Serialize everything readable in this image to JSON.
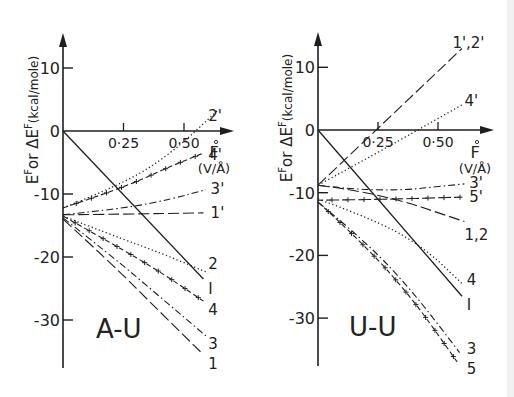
{
  "figure": {
    "edge_band_color": "#f1f1f1",
    "ink_color": "#1e1e1e"
  },
  "chart_data": [
    {
      "type": "line",
      "panel_label": "A-U",
      "ylabel": "E^F or ΔE^F (kcal/mole)",
      "xlabel": "F (V/Å)",
      "xlabel_main": "F",
      "xlabel_unit": "(V/Å)",
      "x_ticks": [
        0.25,
        0.5
      ],
      "x_tick_labels": [
        "0·25",
        "0·50"
      ],
      "y_ticks": [
        10,
        0,
        -10,
        -20,
        -30
      ],
      "y_tick_labels": [
        "10",
        "0",
        "-10",
        "-20",
        "-30"
      ],
      "xlim": [
        0,
        0.72
      ],
      "ylim": [
        -38,
        15
      ],
      "grid": false,
      "legend": "inline labels at line ends",
      "series": [
        {
          "name": "I",
          "style": "solid",
          "x": [
            0,
            0.58
          ],
          "y": [
            0,
            -23.5
          ],
          "label_pos": [
            0.6,
            -24.9
          ]
        },
        {
          "name": "2'",
          "style": "dotted",
          "x": [
            0,
            0.25,
            0.45,
            0.64
          ],
          "y": [
            -12.2,
            -8.4,
            -3.5,
            3.3
          ],
          "label_pos": [
            0.6,
            2.5
          ]
        },
        {
          "name": "4'",
          "style": "dash-cross",
          "x": [
            0,
            0.25,
            0.45,
            0.58
          ],
          "y": [
            -12.2,
            -9.0,
            -5.5,
            -3.5
          ],
          "label_pos": [
            0.6,
            -3.6
          ]
        },
        {
          "name": "3'",
          "style": "dash-dot",
          "x": [
            0,
            0.25,
            0.45,
            0.59
          ],
          "y": [
            -13.3,
            -12.3,
            -10.8,
            -9.3
          ],
          "label_pos": [
            0.61,
            -9.1
          ]
        },
        {
          "name": "1'",
          "style": "long-dash",
          "x": [
            0,
            0.25,
            0.58
          ],
          "y": [
            -13.3,
            -13.2,
            -13.0
          ],
          "label_pos": [
            0.61,
            -12.8
          ]
        },
        {
          "name": "2",
          "style": "dotted",
          "x": [
            0,
            0.2,
            0.4,
            0.6
          ],
          "y": [
            -13.5,
            -16.5,
            -19.3,
            -22.5
          ],
          "label_pos": [
            0.6,
            -20.9
          ]
        },
        {
          "name": "4",
          "style": "dash-cross",
          "x": [
            0,
            0.2,
            0.4,
            0.58
          ],
          "y": [
            -13.5,
            -17.8,
            -22.3,
            -27.0
          ],
          "label_pos": [
            0.6,
            -28.3
          ]
        },
        {
          "name": "3",
          "style": "dash-dot",
          "x": [
            0,
            0.2,
            0.4,
            0.59
          ],
          "y": [
            -13.8,
            -19.8,
            -26.3,
            -32.5
          ],
          "label_pos": [
            0.6,
            -33.6
          ]
        },
        {
          "name": "1",
          "style": "long-dash",
          "x": [
            0,
            0.2,
            0.4,
            0.58
          ],
          "y": [
            -14.0,
            -21.0,
            -28.7,
            -35.5
          ],
          "label_pos": [
            0.6,
            -36.8
          ]
        }
      ]
    },
    {
      "type": "line",
      "panel_label": "U-U",
      "ylabel": "E^F or ΔE^F (kcal/mole)",
      "xlabel": "F (V/Å)",
      "xlabel_main": "F",
      "xlabel_unit": "(V/Å)",
      "x_ticks": [
        0.25,
        0.5
      ],
      "x_tick_labels": [
        "0·25",
        "0·50"
      ],
      "y_ticks": [
        10,
        0,
        -10,
        -20,
        -30
      ],
      "y_tick_labels": [
        "10",
        "0",
        "-10",
        "-20",
        "-30"
      ],
      "xlim": [
        0,
        0.72
      ],
      "ylim": [
        -38,
        15
      ],
      "grid": false,
      "legend": "inline labels at line ends",
      "series": [
        {
          "name": "I",
          "style": "solid",
          "x": [
            0,
            0.6
          ],
          "y": [
            0,
            -26.5
          ],
          "label_pos": [
            0.62,
            -27.8
          ]
        },
        {
          "name": "1',2'",
          "style": "long-dash",
          "x": [
            0,
            0.6
          ],
          "y": [
            -8.8,
            13.0
          ],
          "label_pos": [
            0.56,
            14.0
          ]
        },
        {
          "name": "4'",
          "style": "dotted",
          "x": [
            0,
            0.25,
            0.6
          ],
          "y": [
            -8.8,
            -3.6,
            4.0
          ],
          "label_pos": [
            0.61,
            4.8
          ]
        },
        {
          "name": "3'",
          "style": "dash-dot",
          "x": [
            0,
            0.25,
            0.61
          ],
          "y": [
            -8.8,
            -10.0,
            -8.6
          ],
          "label_pos": [
            0.63,
            -8.3
          ]
        },
        {
          "name": "1,2",
          "style": "long-dash",
          "x": [
            0,
            0.25,
            0.61
          ],
          "y": [
            -8.8,
            -10.0,
            -14.6
          ],
          "label_pos": [
            0.61,
            -16.6
          ]
        },
        {
          "name": "5'",
          "style": "dash-cross",
          "x": [
            0,
            0.25,
            0.6
          ],
          "y": [
            -11.2,
            -11.1,
            -10.7
          ],
          "label_pos": [
            0.63,
            -10.6
          ]
        },
        {
          "name": "4",
          "style": "dotted",
          "x": [
            0,
            0.25,
            0.45,
            0.6
          ],
          "y": [
            -11.0,
            -14.5,
            -19.0,
            -24.5
          ],
          "label_pos": [
            0.62,
            -23.7
          ]
        },
        {
          "name": "3",
          "style": "dash-dot",
          "x": [
            0,
            0.2,
            0.4,
            0.59
          ],
          "y": [
            -11.5,
            -17.8,
            -26.0,
            -35.5
          ],
          "label_pos": [
            0.62,
            -34.8
          ]
        },
        {
          "name": "5",
          "style": "dash-cross",
          "x": [
            0,
            0.2,
            0.4,
            0.58
          ],
          "y": [
            -11.5,
            -18.5,
            -27.2,
            -37.0
          ],
          "label_pos": [
            0.62,
            -38.0
          ]
        }
      ]
    }
  ],
  "layout": {
    "panels": [
      {
        "origin_px": [
          63,
          131
        ],
        "px_per_x": 242,
        "px_per_y": 6.3,
        "y_axis_top": 33,
        "y_axis_bottom": 368,
        "x_axis_end": 234,
        "ylabel_px": [
          38,
          120
        ],
        "panel_label_px": [
          96,
          338
        ],
        "xlabel_px": [
          214,
          158
        ]
      },
      {
        "origin_px": [
          318,
          130
        ],
        "px_per_x": 240,
        "px_per_y": 6.27,
        "y_axis_top": 32,
        "y_axis_bottom": 366,
        "x_axis_end": 494,
        "ylabel_px": [
          292,
          118
        ],
        "panel_label_px": [
          349,
          336
        ],
        "xlabel_px": [
          475,
          158
        ]
      }
    ]
  }
}
